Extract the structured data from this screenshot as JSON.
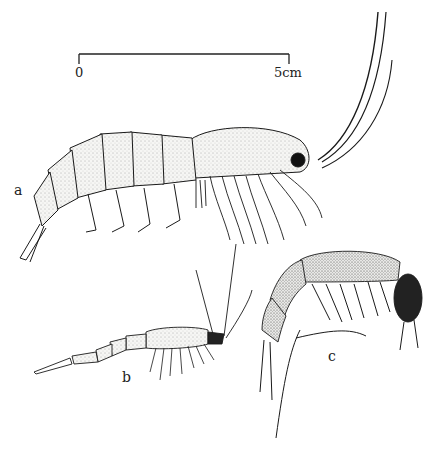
{
  "figure": {
    "scale_bar": {
      "start_label": "0",
      "end_label": "5cm",
      "length_cm": 5
    },
    "specimens": [
      {
        "id": "a",
        "label": "a",
        "description": "large shrimp-like crustacean, lateral view, long antennae"
      },
      {
        "id": "b",
        "label": "b",
        "description": "small slender crustacean, lateral view"
      },
      {
        "id": "c",
        "label": "c",
        "description": "curled amphipod-like crustacean with dark eye"
      }
    ]
  },
  "colors": {
    "background": "#ffffff",
    "ink": "#1a1a1a",
    "body_fill": "#f4f4f2",
    "stipple": "#555555",
    "eye": "#111111"
  }
}
